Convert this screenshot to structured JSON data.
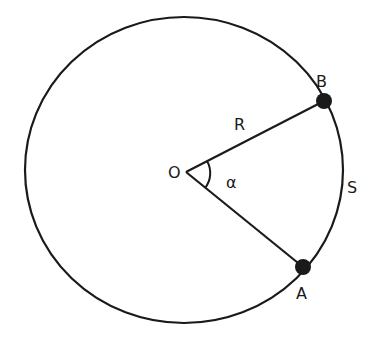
{
  "diagram": {
    "type": "circle-sector",
    "colors": {
      "stroke": "#1a1a1a",
      "background": "#ffffff"
    },
    "circle": {
      "cx": 184,
      "cy": 170,
      "rx": 159,
      "ry": 153
    },
    "center": {
      "label": "O",
      "x": 186,
      "y": 172
    },
    "points": [
      {
        "label": "B",
        "x": 324,
        "y": 101
      },
      {
        "label": "A",
        "x": 303,
        "y": 267
      }
    ],
    "labels": {
      "center": "O",
      "radius": "R",
      "angle": "α",
      "arc": "S",
      "point_b": "B",
      "point_a": "A"
    }
  }
}
